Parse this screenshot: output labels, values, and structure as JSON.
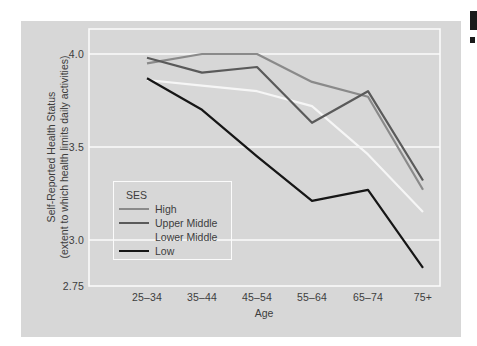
{
  "figure": {
    "y_axis": {
      "title_line1": "Self-Reported Health Status",
      "title_line2": "(extent to which health limits daily activities)",
      "ticks": [
        "4.0",
        "3.5",
        "3.0",
        "2.75"
      ]
    },
    "x_axis": {
      "title": "Age",
      "ticks": [
        "25–34",
        "35–44",
        "45–54",
        "55–64",
        "65–74",
        "75+"
      ]
    },
    "legend": {
      "title": "SES",
      "items": [
        {
          "label": "High",
          "swatch_color": "#8a8a8a"
        },
        {
          "label": "Upper Middle",
          "swatch_color": "#5a5a5a"
        },
        {
          "label": "Lower Middle",
          "swatch_color": "transparent"
        },
        {
          "label": "Low",
          "swatch_color": "#161616"
        }
      ]
    }
  },
  "chart_data": {
    "type": "line",
    "categories": [
      "25–34",
      "35–44",
      "45–54",
      "55–64",
      "65–74",
      "75+"
    ],
    "series": [
      {
        "name": "High",
        "color": "#8a8a8a",
        "values": [
          3.95,
          4.0,
          4.0,
          3.85,
          3.77,
          3.27
        ]
      },
      {
        "name": "Upper Middle",
        "color": "#5a5a5a",
        "values": [
          3.98,
          3.9,
          3.93,
          3.63,
          3.8,
          3.32
        ]
      },
      {
        "name": "Lower Middle",
        "color": "#f6f6f6",
        "values": [
          3.86,
          3.83,
          3.8,
          3.72,
          3.46,
          3.15
        ]
      },
      {
        "name": "Low",
        "color": "#161616",
        "values": [
          3.87,
          3.7,
          3.45,
          3.21,
          3.27,
          2.85
        ]
      }
    ],
    "xlabel": "Age",
    "ylabel": "Self-Reported Health Status (extent to which health limits daily activities)",
    "ylim": [
      2.75,
      4.13
    ],
    "yticks": [
      4.0,
      3.5,
      3.0,
      2.75
    ],
    "ytick_labels": [
      "4.0",
      "3.5",
      "3.0",
      "2.75"
    ],
    "grid": "horizontal",
    "gridline_color": "#fbfbfb",
    "background_color": "#d7d7d7",
    "legend_title": "SES",
    "legend_position": "inside-lower-left"
  },
  "artifacts": {
    "description": "cropped black print marks at top-right page edge"
  }
}
